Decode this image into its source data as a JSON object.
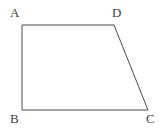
{
  "figure": {
    "kind": "geometry-diagram",
    "shape_name": "trapezoid-ABCD",
    "background_color": "#ffffff",
    "stroke_color": "#4a4a4a",
    "stroke_width": 1,
    "label_color": "#3d3d3d",
    "vertices": [
      {
        "id": "A",
        "label": "A",
        "x": 22,
        "y": 25,
        "label_x": 10,
        "label_y": 6
      },
      {
        "id": "D",
        "label": "D",
        "x": 114,
        "y": 25,
        "label_x": 112,
        "label_y": 6
      },
      {
        "id": "C",
        "label": "C",
        "x": 148,
        "y": 110,
        "label_x": 146,
        "label_y": 112
      },
      {
        "id": "B",
        "label": "B",
        "x": 22,
        "y": 110,
        "label_x": 10,
        "label_y": 112
      }
    ],
    "edges": [
      {
        "id": "AD",
        "from": "A",
        "to": "D"
      },
      {
        "id": "DC",
        "from": "D",
        "to": "C"
      },
      {
        "id": "CB",
        "from": "C",
        "to": "B"
      },
      {
        "id": "BA",
        "from": "B",
        "to": "A"
      }
    ],
    "polygon_points": "22,25 114,25 148,110 22,110"
  }
}
